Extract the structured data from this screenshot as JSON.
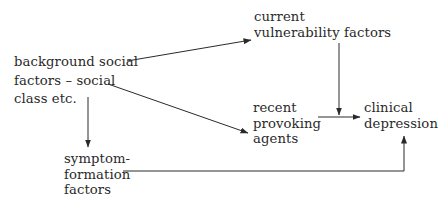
{
  "diagram": {
    "nodes": {
      "background": {
        "lines": [
          "background social",
          "factors – social",
          "class etc."
        ]
      },
      "vulnerability": {
        "lines": [
          "current",
          "vulnerability factors"
        ]
      },
      "provoking": {
        "lines": [
          "recent",
          "provoking",
          "agents"
        ]
      },
      "depression": {
        "lines": [
          "clinical",
          "depression"
        ]
      },
      "symptom": {
        "lines": [
          "symptom-",
          "formation",
          "factors"
        ]
      }
    },
    "edges": [
      {
        "from": "background social factors – social class etc.",
        "to": "current vulnerability factors"
      },
      {
        "from": "background social factors – social class etc.",
        "to": "recent provoking agents"
      },
      {
        "from": "background social factors – social class etc.",
        "to": "symptom-formation factors"
      },
      {
        "from": "current vulnerability factors",
        "to": "recent provoking agents → clinical depression (link)"
      },
      {
        "from": "recent provoking agents",
        "to": "clinical depression"
      },
      {
        "from": "symptom-formation factors",
        "to": "clinical depression"
      }
    ],
    "colors": {
      "ink": "#2a2a2a",
      "background": "#ffffff"
    }
  }
}
